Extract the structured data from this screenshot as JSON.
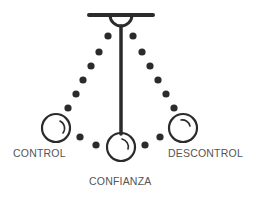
{
  "diagram": {
    "labels": {
      "left": "CONTROL",
      "center": "CONFIANZA",
      "right": "DESCONTROL"
    },
    "colors": {
      "stroke": "#2b2b2b",
      "text": "#555555",
      "background": "#ffffff"
    },
    "icons": {
      "support": "ceiling-bar-icon",
      "bob": "pendulum-ball-icon",
      "trail": "dotted-swing-path"
    }
  }
}
